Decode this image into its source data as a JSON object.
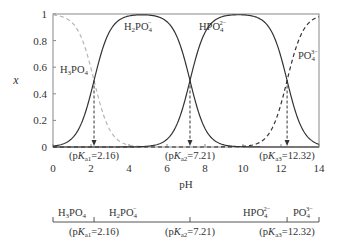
{
  "chart_data": [
    {
      "type": "line",
      "title": "",
      "xlabel": "pH",
      "ylabel": "x",
      "xlim": [
        0,
        14
      ],
      "ylim": [
        0,
        1
      ],
      "grid": false,
      "legend": "inline labels on curves",
      "x_ticks": [
        "0",
        "2",
        "4",
        "6",
        "8",
        "10",
        "12",
        "14"
      ],
      "y_ticks": [
        "0",
        "0.2",
        "0.4",
        "0.6",
        "0.8",
        "1"
      ],
      "pKa": [
        2.16,
        7.21,
        12.32
      ],
      "series": [
        {
          "name": "H3PO4",
          "label_main": "H",
          "label_sub1": "3",
          "label_mid": "PO",
          "label_sub2": "4",
          "label_sup": "",
          "style": "dashed-light"
        },
        {
          "name": "H2PO4-",
          "label_main": "H",
          "label_sub1": "2",
          "label_mid": "PO",
          "label_sub2": "4",
          "label_sup": "−",
          "style": "solid"
        },
        {
          "name": "HPO4 2-",
          "label_main": "",
          "label_sub1": "",
          "label_mid": "HPO",
          "label_sub2": "4",
          "label_sup": "2−",
          "style": "solid"
        },
        {
          "name": "PO4 3-",
          "label_main": "",
          "label_sub1": "",
          "label_mid": "PO",
          "label_sub2": "4",
          "label_sup": "3−",
          "style": "dashed-dark"
        }
      ],
      "annotations": [
        {
          "text_pre": "(p",
          "text_k": "K",
          "text_sub": "a1",
          "text_post": "=2.16)",
          "x": 2.16,
          "y": 0.5
        },
        {
          "text_pre": "(p",
          "text_k": "K",
          "text_sub": "a2",
          "text_post": "=7.21)",
          "x": 7.21,
          "y": 0.5
        },
        {
          "text_pre": "(p",
          "text_k": "K",
          "text_sub": "a3",
          "text_post": "=12.32)",
          "x": 12.32,
          "y": 0.5
        }
      ]
    },
    {
      "type": "number-line",
      "regions": [
        "H3PO4",
        "H2PO4-",
        "HPO4 2-",
        "PO4 3-"
      ],
      "boundaries": [
        2.16,
        7.21,
        12.32
      ],
      "range": [
        0,
        14
      ]
    }
  ],
  "colors": {
    "axis": "#888888",
    "solid": "#333333",
    "dashed_light": "#b5b5b5",
    "dashed_dark": "#333333",
    "text": "#333333"
  }
}
